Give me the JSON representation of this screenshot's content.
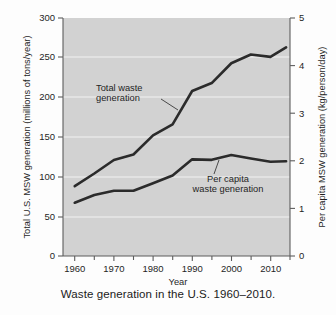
{
  "figure": {
    "caption": "Waste generation in the U.S. 1960–2010."
  },
  "chart_data": {
    "type": "line",
    "title": "",
    "xlabel": "Year",
    "ylabel": "Total U.S. MSW generation (millions of tons/year)",
    "y2label": "Per capita MSW generation (kg/person/day)",
    "xlim": [
      1957,
      2015
    ],
    "ylim": [
      0,
      300
    ],
    "y2lim": [
      0,
      5
    ],
    "grid": true,
    "legend_position": "inline-annotations",
    "background_color": "#d2d2d2",
    "line_color": "#2b2b2b",
    "xticks": [
      1960,
      1970,
      1980,
      1990,
      2000,
      2010
    ],
    "xtick_labels": [
      "1960",
      "1970",
      "1980",
      "1990",
      "2000",
      "2010"
    ],
    "xminor_ticks": [
      1965,
      1975,
      1985,
      1995,
      2005,
      2015
    ],
    "yticks": [
      0,
      50,
      100,
      150,
      200,
      250,
      300
    ],
    "ytick_labels": [
      "0",
      "50",
      "100",
      "150",
      "200",
      "250",
      "300"
    ],
    "y2ticks": [
      0,
      1,
      2,
      3,
      4,
      5
    ],
    "y2tick_labels": [
      "0",
      "1",
      "2",
      "3",
      "4",
      "5"
    ],
    "series": [
      {
        "name": "Total waste generation",
        "axis": "left",
        "units": "millions of tons/year",
        "x": [
          1960,
          1965,
          1970,
          1975,
          1980,
          1985,
          1990,
          1995,
          2000,
          2005,
          2010,
          2014
        ],
        "values": [
          88,
          104,
          121,
          128,
          152,
          166,
          208,
          218,
          243,
          254,
          251,
          263
        ]
      },
      {
        "name": "Per capita waste generation",
        "axis": "right",
        "units": "kg/person/day",
        "x": [
          1960,
          1965,
          1970,
          1975,
          1980,
          1985,
          1990,
          1995,
          2000,
          2005,
          2010,
          2014
        ],
        "values": [
          1.12,
          1.28,
          1.37,
          1.37,
          1.53,
          1.69,
          2.03,
          2.02,
          2.12,
          2.05,
          1.98,
          1.99
        ]
      }
    ],
    "annotations": [
      {
        "name": "total-waste-label",
        "line1": "Total waste",
        "line2": "generation"
      },
      {
        "name": "per-capita-label",
        "line1": "Per capita",
        "line2": "waste generation"
      }
    ]
  }
}
